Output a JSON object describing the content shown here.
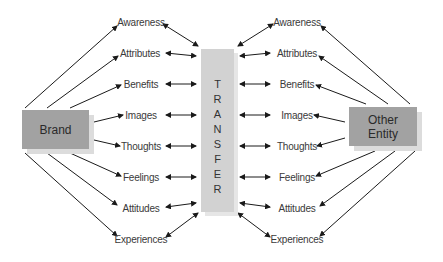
{
  "diagram": {
    "left_entity": "Brand",
    "right_entity_line1": "Other",
    "right_entity_line2": "Entity",
    "center_label": "TRANSFER",
    "center_letters": [
      "T",
      "R",
      "A",
      "N",
      "S",
      "F",
      "E",
      "R"
    ],
    "left_items": [
      "Awareness",
      "Attributes",
      "Benefits",
      "Images",
      "Thoughts",
      "Feelings",
      "Attitudes",
      "Experiences"
    ],
    "right_items": [
      "Awareness",
      "Attributes",
      "Benefits",
      "Images",
      "Thoughts",
      "Feelings",
      "Attitudes",
      "Experiences"
    ],
    "colors": {
      "entity_box": "#a2a2a2",
      "transfer_bar": "#d2d2d2",
      "shadow": "#dcdcdc",
      "arrow": "#1a1a1a"
    }
  }
}
